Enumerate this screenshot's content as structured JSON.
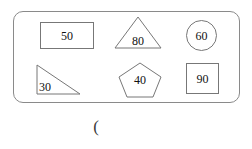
{
  "diagram": {
    "type": "shape-group",
    "container": {
      "name": "rounded-rectangle-panel",
      "border_color": "#8a8a8a",
      "corner_radius_px": 10
    },
    "stroke_color": "#777777",
    "text_color": "#111111",
    "background_color": "#ffffff",
    "rows": 2,
    "columns": 3,
    "shapes": [
      {
        "shape": "rectangle",
        "label": "50",
        "row": 1,
        "column": 1
      },
      {
        "shape": "triangle",
        "label": "80",
        "row": 1,
        "column": 2
      },
      {
        "shape": "circle",
        "label": "60",
        "row": 1,
        "column": 3
      },
      {
        "shape": "right-triangle",
        "label": "30",
        "row": 2,
        "column": 1
      },
      {
        "shape": "pentagon",
        "label": "40",
        "row": 2,
        "column": 2
      },
      {
        "shape": "square",
        "label": "90",
        "row": 2,
        "column": 3
      }
    ]
  },
  "caption": {
    "text": "("
  }
}
